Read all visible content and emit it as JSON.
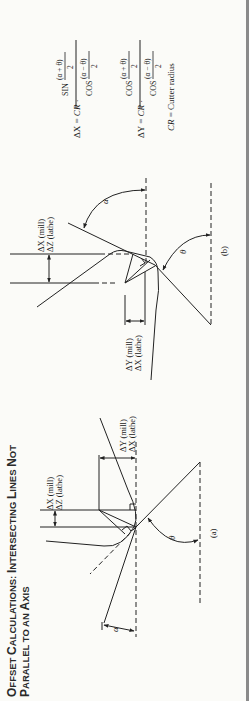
{
  "title": {
    "line1_big1": "O",
    "line1_small1": "FFSET ",
    "line1_big2": "C",
    "line1_small2": "ALCULATIONS: ",
    "line1_big3": "I",
    "line1_small3": "NTERSECTING ",
    "line1_big4": "L",
    "line1_small4": "INES ",
    "line1_big5": "N",
    "line1_small5": "OT",
    "line2_big1": "P",
    "line2_small1": "ARALLEL TO AN ",
    "line2_big2": "A",
    "line2_small2": "XIS",
    "full": "OFFSET CALCULATIONS: INTERSECTING LINES NOT PARALLEL TO AN AXIS"
  },
  "diagram_a": {
    "caption": "(a)",
    "dim1_line1": "ΔX (mill)",
    "dim1_line2": "ΔZ (lathe)",
    "dim2_line1": "ΔY (mill)",
    "dim2_line2": "ΔX (lathe)",
    "angle_alpha": "α",
    "angle_theta": "θ"
  },
  "diagram_b": {
    "caption": "(b)",
    "dim1_line1": "ΔX (mill)",
    "dim1_line2": "ΔZ (lathe)",
    "dim2_line1": "ΔY (mill)",
    "dim2_line2": "ΔX (lathe)",
    "angle_alpha": "α",
    "angle_theta": "θ"
  },
  "formulas": {
    "dx_lhs": "ΔX = ",
    "dx_cr": "CR",
    "dx_dot": " ·",
    "dx_num_fn": "SIN",
    "dx_num_arg": "(α + θ)",
    "dx_num_den": "2",
    "dx_den_fn": "COS",
    "dx_den_arg": "(α − θ)",
    "dx_den_den": "2",
    "dy_lhs": "ΔY = ",
    "dy_cr": "CR",
    "dy_dot": " ·",
    "dy_num_fn": "COS",
    "dy_num_arg": "(α + θ)",
    "dy_num_den": "2",
    "dy_den_fn": "COS",
    "dy_den_arg": "(α − θ)",
    "dy_den_den": "2",
    "legend_cr": "CR",
    "legend_text": " = Cutter radius"
  }
}
